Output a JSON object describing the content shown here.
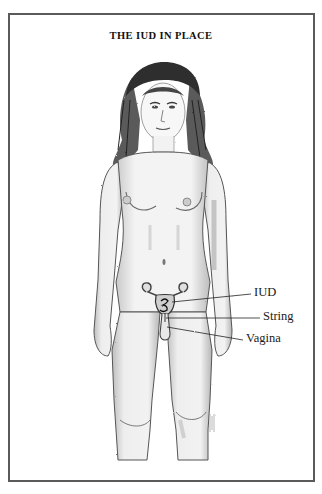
{
  "title": "THE IUD IN PLACE",
  "labels": {
    "iud": "IUD",
    "string": "String",
    "vagina": "Vagina"
  },
  "figure": {
    "callouts": [
      {
        "label": "IUD",
        "target": "uterus"
      },
      {
        "label": "String",
        "target": "cervix string"
      },
      {
        "label": "Vagina",
        "target": "vaginal canal"
      }
    ]
  },
  "colors": {
    "ink": "#1a1a1a",
    "border": "#5a5a5a",
    "paper": "#ffffff",
    "shade": "#9a9a9a"
  }
}
